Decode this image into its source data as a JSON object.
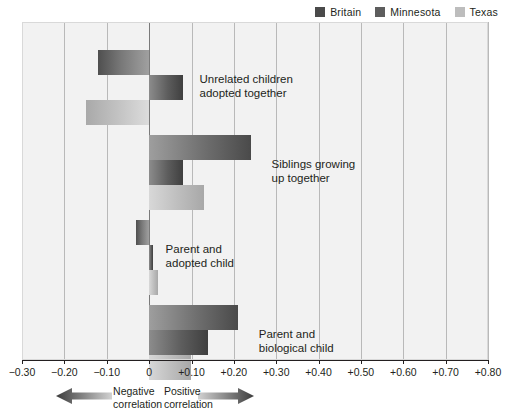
{
  "legend": {
    "items": [
      {
        "label": "Britain",
        "color": "#4a4a4a"
      },
      {
        "label": "Minnesota",
        "color": "#5d5d5d"
      },
      {
        "label": "Texas",
        "color": "#bdbdbd"
      }
    ]
  },
  "axis": {
    "tick_labels": [
      "−0.30",
      "−0.20",
      "−0.10",
      "0",
      "+0.10",
      "+0.20",
      "+0.30",
      "+0.40",
      "+0.50",
      "+0.60",
      "+0.70",
      "+0.80"
    ],
    "tick_values": [
      -0.3,
      -0.2,
      -0.1,
      0,
      0.1,
      0.2,
      0.3,
      0.4,
      0.5,
      0.6,
      0.7,
      0.8
    ]
  },
  "annotations": {
    "negative": "Negative\ncorrelation",
    "positive": "Positive\ncorrelation",
    "negative_arrow_icon": "left-arrow-icon",
    "positive_arrow_icon": "right-arrow-icon"
  },
  "groups": [
    {
      "label": "Unrelated children\nadopted together"
    },
    {
      "label": "Siblings growing\nup together"
    },
    {
      "label": "Parent and\nadopted child"
    },
    {
      "label": "Parent and\nbiological child"
    }
  ],
  "chart_data": {
    "type": "bar",
    "orientation": "horizontal",
    "title": "",
    "xlabel": "Correlation",
    "ylabel": "",
    "xlim": [
      -0.3,
      0.8
    ],
    "xticks": [
      -0.3,
      -0.2,
      -0.1,
      0,
      0.1,
      0.2,
      0.3,
      0.4,
      0.5,
      0.6,
      0.7,
      0.8
    ],
    "grid": true,
    "legend_position": "top-right",
    "categories": [
      "Unrelated children adopted together",
      "Siblings growing up together",
      "Parent and adopted child",
      "Parent and biological child"
    ],
    "series": [
      {
        "name": "Britain",
        "color": "#4a4a4a",
        "values": [
          -0.12,
          0.24,
          -0.03,
          0.21
        ]
      },
      {
        "name": "Minnesota",
        "color": "#5d5d5d",
        "values": [
          0.08,
          0.08,
          0.01,
          0.14
        ]
      },
      {
        "name": "Texas",
        "color": "#bdbdbd",
        "values": [
          -0.15,
          0.13,
          0.02,
          0.1
        ]
      }
    ],
    "annotations": [
      "Negative correlation",
      "Positive correlation"
    ]
  }
}
